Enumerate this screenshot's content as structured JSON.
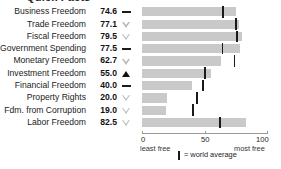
{
  "top_fragment": "Quick Facts",
  "chart_data": {
    "type": "bar",
    "orientation": "horizontal",
    "title": "",
    "xlabel": "",
    "ylabel": "",
    "xlim": [
      0,
      100
    ],
    "xticks": [
      0,
      50,
      100
    ],
    "xticklabels": [
      "0",
      "50",
      "100"
    ],
    "grid": false,
    "categories": [
      "Business Freedom",
      "Trade Freedom",
      "Fiscal Freedom",
      "Government Spending",
      "Monetary Freedom",
      "Investment Freedom",
      "Financial Freedom",
      "Property Rights",
      "Fdm. from Corruption",
      "Labor Freedom"
    ],
    "values": [
      74.6,
      77.1,
      79.5,
      77.5,
      62.7,
      55.0,
      40.0,
      20.0,
      19.0,
      82.5
    ],
    "value_labels": [
      "74.6",
      "77.1",
      "79.5",
      "77.5",
      "62.7",
      "55.0",
      "40.0",
      "20.0",
      "19.0",
      "82.5"
    ],
    "trend_markers": [
      "dash",
      "down-triangle",
      "down-triangle",
      "dash",
      "down-triangle",
      "up-triangle-filled",
      "dash",
      "down-triangle",
      "down-triangle",
      "down-triangle"
    ],
    "world_average": [
      64.3,
      74.8,
      75.4,
      63.9,
      73.4,
      50.2,
      48.5,
      43.6,
      40.5,
      62.1
    ],
    "series": [
      {
        "name": "Country score",
        "values": [
          74.6,
          77.1,
          79.5,
          77.5,
          62.7,
          55.0,
          40.0,
          20.0,
          19.0,
          82.5
        ]
      },
      {
        "name": "World average",
        "values": [
          64.3,
          74.8,
          75.4,
          63.9,
          73.4,
          50.2,
          48.5,
          43.6,
          40.5,
          62.1
        ]
      }
    ],
    "annotations": {
      "axis_left": "least free",
      "axis_right": "most free",
      "legend": "= world average"
    },
    "colors": {
      "bar": "#c9c9c9",
      "average_marker": "#1a1a1a",
      "down_triangle": "#b9b9b9",
      "up_triangle": "#111111",
      "dash": "#1b1b1b",
      "axis": "#9a9a9a",
      "text": "#1c1c1c"
    }
  }
}
